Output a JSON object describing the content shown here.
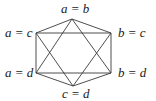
{
  "diagram": {
    "type": "graph",
    "stroke_color": "#3a3a3a",
    "vertices": [
      {
        "id": "top",
        "label": "a = b",
        "x": 72,
        "y": 19
      },
      {
        "id": "upper_right",
        "label": "b = c",
        "x": 111,
        "y": 33
      },
      {
        "id": "lower_right",
        "label": "b = d",
        "x": 111,
        "y": 73
      },
      {
        "id": "bottom",
        "label": "c = d",
        "x": 73,
        "y": 86
      },
      {
        "id": "lower_left",
        "label": "a = d",
        "x": 36,
        "y": 73
      },
      {
        "id": "upper_left",
        "label": "a = c",
        "x": 36,
        "y": 33
      }
    ],
    "edges": [
      [
        "top",
        "upper_left"
      ],
      [
        "top",
        "upper_right"
      ],
      [
        "top",
        "lower_left"
      ],
      [
        "top",
        "lower_right"
      ],
      [
        "bottom",
        "upper_left"
      ],
      [
        "bottom",
        "upper_right"
      ],
      [
        "bottom",
        "lower_left"
      ],
      [
        "bottom",
        "lower_right"
      ],
      [
        "upper_left",
        "upper_right"
      ],
      [
        "lower_left",
        "lower_right"
      ],
      [
        "upper_left",
        "lower_left"
      ],
      [
        "upper_right",
        "lower_right"
      ]
    ]
  },
  "labels": {
    "top": "a = b",
    "upper_left": "a = c",
    "upper_right": "b = c",
    "lower_left": "a = d",
    "lower_right": "b = d",
    "bottom": "c = d"
  }
}
